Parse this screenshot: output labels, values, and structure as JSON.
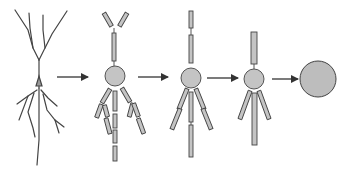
{
  "diagram": {
    "title": "",
    "colors": {
      "background": "#ffffff",
      "stroke": "#3a3a3a",
      "fill": "#bdbdbd",
      "arrow": "#333333"
    },
    "stages": [
      {
        "id": "stage-1",
        "label": "intact-neuron"
      },
      {
        "id": "stage-2",
        "label": "fragmented-processes"
      },
      {
        "id": "stage-3",
        "label": "reduced-processes"
      },
      {
        "id": "stage-4",
        "label": "minimal-processes"
      },
      {
        "id": "stage-5",
        "label": "isolated-soma"
      }
    ],
    "arrows": [
      {
        "x1": 57,
        "y1": 77,
        "x2": 88,
        "y2": 77
      },
      {
        "x1": 138,
        "y1": 77,
        "x2": 168,
        "y2": 77
      },
      {
        "x1": 207,
        "y1": 78,
        "x2": 238,
        "y2": 78
      },
      {
        "x1": 272,
        "y1": 79,
        "x2": 298,
        "y2": 79
      }
    ]
  }
}
